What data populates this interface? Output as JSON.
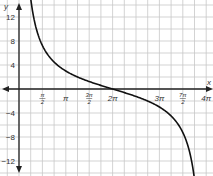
{
  "chart_data": {
    "type": "line",
    "title": "",
    "function": "y = 3 cot(x/4)",
    "xlabel": "x",
    "ylabel": "y",
    "xlim": [
      -1.0,
      12.8
    ],
    "ylim": [
      -14,
      15
    ],
    "grid": true,
    "x_ticks": [
      {
        "value": 1.5708,
        "label": "π/2",
        "num": "π",
        "den": "2"
      },
      {
        "value": 3.1416,
        "label": "π"
      },
      {
        "value": 4.7124,
        "label": "3π/2",
        "num": "3π",
        "den": "2"
      },
      {
        "value": 6.2832,
        "label": "2π"
      },
      {
        "value": 9.4248,
        "label": "3π"
      },
      {
        "value": 10.9956,
        "label": "7π/2",
        "num": "7π",
        "den": "2"
      },
      {
        "value": 12.5664,
        "label": "4π"
      }
    ],
    "y_ticks": [
      {
        "value": 12,
        "label": "12"
      },
      {
        "value": 8,
        "label": "8"
      },
      {
        "value": 4,
        "label": "4"
      },
      {
        "value": -4,
        "label": "−4"
      },
      {
        "value": -8,
        "label": "−8"
      },
      {
        "value": -12,
        "label": "−12"
      }
    ],
    "series": [
      {
        "name": "y = 3cot(x/4)",
        "x": [
          0.785,
          1.571,
          3.142,
          4.712,
          6.283,
          7.854,
          9.425,
          10.996,
          11.781
        ],
        "y": [
          12.06,
          7.24,
          3.0,
          1.24,
          0.0,
          -1.24,
          -3.0,
          -7.24,
          -12.06
        ]
      }
    ],
    "asymptotes_x": [
      0,
      12.5664
    ],
    "colors": {
      "curve": "#111111",
      "grid": "#c8c8c8",
      "axis": "#222222"
    }
  }
}
